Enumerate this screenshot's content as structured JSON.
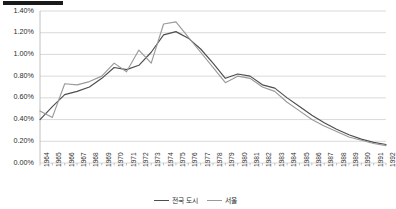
{
  "chart_data": {
    "type": "line",
    "title": "",
    "subtitle": "",
    "xlabel": "",
    "ylabel": "",
    "grid": true,
    "legend_position": "bottom",
    "ylim": [
      0,
      1.4
    ],
    "ytick_labels": [
      "1.40%",
      "1.20%",
      "1.00%",
      "0.80%",
      "0.60%",
      "0.40%",
      "0.20%",
      "0.00%"
    ],
    "ytick_values": [
      1.4,
      1.2,
      1.0,
      0.8,
      0.6,
      0.4,
      0.2,
      0.0
    ],
    "categories": [
      "1964",
      "1965",
      "1966",
      "1967",
      "1968",
      "1969",
      "1970",
      "1971",
      "1972",
      "1973",
      "1974",
      "1975",
      "1976",
      "1977",
      "1978",
      "1979",
      "1980",
      "1981",
      "1982",
      "1983",
      "1984",
      "1985",
      "1986",
      "1987",
      "1988",
      "1989",
      "1990",
      "1991",
      "1992"
    ],
    "series": [
      {
        "name": "전국 도시",
        "color": "#4d4d4d",
        "values": [
          0.4,
          0.52,
          0.63,
          0.66,
          0.7,
          0.78,
          0.88,
          0.86,
          0.9,
          1.02,
          1.18,
          1.21,
          1.15,
          1.05,
          0.92,
          0.78,
          0.82,
          0.8,
          0.72,
          0.69,
          0.6,
          0.52,
          0.44,
          0.37,
          0.31,
          0.26,
          0.22,
          0.19,
          0.17
        ]
      },
      {
        "name": "서울",
        "color": "#9a9a9a",
        "values": [
          0.48,
          0.42,
          0.73,
          0.72,
          0.75,
          0.8,
          0.92,
          0.84,
          1.04,
          0.92,
          1.28,
          1.3,
          1.16,
          1.02,
          0.88,
          0.74,
          0.8,
          0.78,
          0.7,
          0.66,
          0.56,
          0.48,
          0.4,
          0.34,
          0.29,
          0.24,
          0.21,
          0.18,
          0.16
        ]
      }
    ]
  },
  "legend": {
    "entries": [
      {
        "label": "전국 도시"
      },
      {
        "label": "서울"
      }
    ]
  },
  "decorations": {
    "top_bar": "black-rule"
  }
}
